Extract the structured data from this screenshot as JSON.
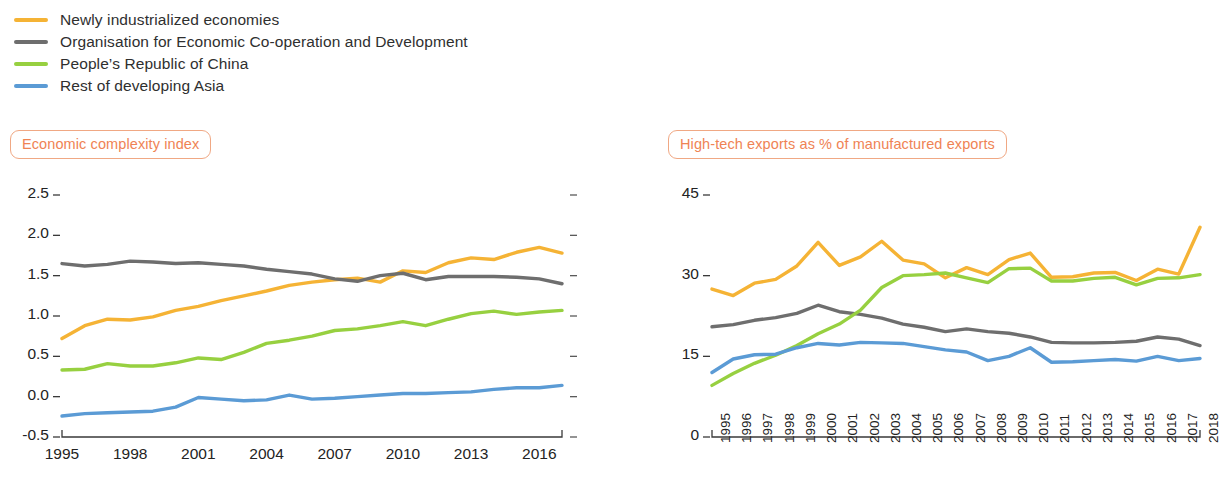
{
  "legend": {
    "items": [
      {
        "label": "Newly industrialized economies",
        "color": "#f5b335",
        "key": "nie"
      },
      {
        "label": "Organisation for Economic Co-operation and Development",
        "color": "#6e6e6e",
        "key": "oecd"
      },
      {
        "label": "People’s Republic of China",
        "color": "#97d040",
        "key": "prc"
      },
      {
        "label": "Rest of developing Asia",
        "color": "#5b9bd5",
        "key": "rda"
      }
    ]
  },
  "panels": {
    "left": {
      "title": "Economic complexity index"
    },
    "right": {
      "title": "High-tech exports as % of manufactured exports"
    }
  },
  "chart_data": [
    {
      "id": "economic-complexity-index",
      "type": "line",
      "title": "Economic complexity index",
      "xlabel": "",
      "ylabel": "",
      "grid": false,
      "legend_position": "above-figure",
      "xlim": [
        1995,
        2017
      ],
      "ylim": [
        -0.5,
        2.5
      ],
      "yticks": [
        -0.5,
        0.0,
        0.5,
        1.0,
        1.5,
        2.0,
        2.5
      ],
      "ytick_labels": [
        "-0.5",
        "0.0",
        "0.5",
        "1.0",
        "1.5",
        "2.0",
        "2.5"
      ],
      "xticks": [
        1995,
        1998,
        2001,
        2004,
        2007,
        2010,
        2013,
        2016
      ],
      "xtick_labels": [
        "1995",
        "1998",
        "2001",
        "2004",
        "2007",
        "2010",
        "2013",
        "2016"
      ],
      "x": [
        1995,
        1996,
        1997,
        1998,
        1999,
        2000,
        2001,
        2002,
        2003,
        2004,
        2005,
        2006,
        2007,
        2008,
        2009,
        2010,
        2011,
        2012,
        2013,
        2014,
        2015,
        2016,
        2017
      ],
      "series": [
        {
          "name": "Newly industrialized economies",
          "color": "#f5b335",
          "values": [
            0.72,
            0.88,
            0.96,
            0.95,
            0.99,
            1.07,
            1.12,
            1.19,
            1.25,
            1.31,
            1.38,
            1.42,
            1.45,
            1.47,
            1.42,
            1.56,
            1.54,
            1.66,
            1.72,
            1.7,
            1.79,
            1.85,
            1.78
          ]
        },
        {
          "name": "Organisation for Economic Co-operation and Development",
          "color": "#6e6e6e",
          "values": [
            1.65,
            1.62,
            1.64,
            1.68,
            1.67,
            1.65,
            1.66,
            1.64,
            1.62,
            1.58,
            1.55,
            1.52,
            1.46,
            1.43,
            1.5,
            1.53,
            1.45,
            1.49,
            1.49,
            1.49,
            1.48,
            1.46,
            1.4
          ]
        },
        {
          "name": "People’s Republic of China",
          "color": "#97d040",
          "values": [
            0.33,
            0.34,
            0.41,
            0.38,
            0.38,
            0.42,
            0.48,
            0.46,
            0.55,
            0.66,
            0.7,
            0.75,
            0.82,
            0.84,
            0.88,
            0.93,
            0.88,
            0.96,
            1.03,
            1.06,
            1.02,
            1.05,
            1.07
          ]
        },
        {
          "name": "Rest of developing Asia",
          "color": "#5b9bd5",
          "values": [
            -0.24,
            -0.21,
            -0.2,
            -0.19,
            -0.18,
            -0.13,
            -0.01,
            -0.03,
            -0.05,
            -0.04,
            0.02,
            -0.03,
            -0.02,
            0.0,
            0.02,
            0.04,
            0.04,
            0.05,
            0.06,
            0.09,
            0.11,
            0.11,
            0.14
          ]
        }
      ]
    },
    {
      "id": "high-tech-exports",
      "type": "line",
      "title": "High-tech exports as % of manufactured exports",
      "xlabel": "",
      "ylabel": "",
      "grid": false,
      "legend_position": "above-figure",
      "xlim": [
        1995,
        2018
      ],
      "ylim": [
        0,
        45
      ],
      "yticks": [
        0,
        15,
        30,
        45
      ],
      "ytick_labels": [
        "0",
        "15",
        "30",
        "45"
      ],
      "xticks": [
        1995,
        1996,
        1997,
        1998,
        1999,
        2000,
        2001,
        2002,
        2003,
        2004,
        2005,
        2006,
        2007,
        2008,
        2009,
        2010,
        2011,
        2012,
        2013,
        2014,
        2015,
        2016,
        2017,
        2018
      ],
      "xtick_labels": [
        "1995",
        "1996",
        "1997",
        "1998",
        "1999",
        "2000",
        "2001",
        "2002",
        "2003",
        "2004",
        "2005",
        "2006",
        "2007",
        "2008",
        "2009",
        "2010",
        "2011",
        "2012",
        "2013",
        "2014",
        "2015",
        "2016",
        "2017",
        "2018"
      ],
      "x": [
        1995,
        1996,
        1997,
        1998,
        1999,
        2000,
        2001,
        2002,
        2003,
        2004,
        2005,
        2006,
        2007,
        2008,
        2009,
        2010,
        2011,
        2012,
        2013,
        2014,
        2015,
        2016,
        2017,
        2018
      ],
      "series": [
        {
          "name": "Newly industrialized economies",
          "color": "#f5b335",
          "values": [
            27.5,
            26.3,
            28.6,
            29.3,
            31.8,
            36.2,
            31.9,
            33.5,
            36.4,
            32.9,
            32.2,
            29.6,
            31.5,
            30.2,
            33.0,
            34.2,
            29.7,
            29.8,
            30.5,
            30.6,
            29.1,
            31.2,
            30.3,
            39.0
          ]
        },
        {
          "name": "Organisation for Economic Co-operation and Development",
          "color": "#6e6e6e",
          "values": [
            20.5,
            20.9,
            21.7,
            22.2,
            23.0,
            24.5,
            23.3,
            22.8,
            22.1,
            21.0,
            20.4,
            19.6,
            20.1,
            19.6,
            19.3,
            18.6,
            17.6,
            17.5,
            17.5,
            17.6,
            17.8,
            18.6,
            18.2,
            17.0
          ]
        },
        {
          "name": "People’s Republic of China",
          "color": "#97d040",
          "values": [
            9.6,
            11.8,
            13.7,
            15.2,
            17.0,
            19.2,
            21.0,
            23.6,
            27.8,
            30.0,
            30.2,
            30.5,
            29.6,
            28.7,
            31.3,
            31.4,
            29.0,
            29.0,
            29.5,
            29.7,
            28.3,
            29.5,
            29.6,
            30.2
          ]
        },
        {
          "name": "Rest of developing Asia",
          "color": "#5b9bd5",
          "values": [
            12.0,
            14.5,
            15.3,
            15.4,
            16.6,
            17.4,
            17.1,
            17.6,
            17.5,
            17.4,
            16.8,
            16.2,
            15.8,
            14.2,
            15.0,
            16.6,
            13.9,
            14.0,
            14.2,
            14.4,
            14.1,
            15.0,
            14.2,
            14.6
          ]
        }
      ]
    }
  ]
}
